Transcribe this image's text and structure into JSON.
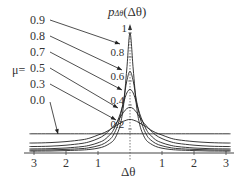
{
  "chart_data": {
    "type": "line",
    "xlabel": "Δθ",
    "ylabel": "p_{Δθ}(Δθ)",
    "xlim": [
      -3.14,
      3.14
    ],
    "ylim": [
      0,
      1.05
    ],
    "x_tick_labels": [
      "3",
      "2",
      "1",
      "1",
      "2",
      "3"
    ],
    "x_ticks": [
      -3,
      -2,
      -1,
      1,
      2,
      3
    ],
    "y_tick_labels": [
      "1",
      "0.8",
      "0.6",
      "0.4",
      "0.2"
    ],
    "y_ticks": [
      1,
      0.8,
      0.6,
      0.4,
      0.2
    ],
    "grid": false,
    "legend_prefix": "μ=",
    "legend_position": "left, with arrows pointing to curves",
    "x": [
      0,
      0.1,
      0.2,
      0.3,
      0.4,
      0.5,
      0.6,
      0.8,
      1.0,
      1.25,
      1.5,
      2.0,
      2.5,
      3.0,
      3.14
    ],
    "series": [
      {
        "name": "0.9",
        "peak": 1.0,
        "values": [
          1.0,
          0.7,
          0.4,
          0.24,
          0.16,
          0.11,
          0.085,
          0.055,
          0.04,
          0.03,
          0.025,
          0.02,
          0.017,
          0.016,
          0.016
        ]
      },
      {
        "name": "0.8",
        "peak": 0.68,
        "values": [
          0.68,
          0.6,
          0.44,
          0.31,
          0.22,
          0.16,
          0.12,
          0.08,
          0.06,
          0.045,
          0.037,
          0.03,
          0.026,
          0.024,
          0.024
        ]
      },
      {
        "name": "0.7",
        "peak": 0.53,
        "values": [
          0.53,
          0.5,
          0.42,
          0.33,
          0.26,
          0.2,
          0.16,
          0.11,
          0.085,
          0.065,
          0.053,
          0.042,
          0.036,
          0.034,
          0.034
        ]
      },
      {
        "name": "0.5",
        "peak": 0.38,
        "values": [
          0.38,
          0.37,
          0.34,
          0.3,
          0.26,
          0.23,
          0.2,
          0.15,
          0.12,
          0.095,
          0.08,
          0.065,
          0.057,
          0.054,
          0.054
        ]
      },
      {
        "name": "0.3",
        "peak": 0.28,
        "values": [
          0.28,
          0.275,
          0.265,
          0.25,
          0.235,
          0.22,
          0.2,
          0.17,
          0.15,
          0.125,
          0.11,
          0.095,
          0.087,
          0.083,
          0.083
        ]
      },
      {
        "name": "0.0",
        "peak": 0.16,
        "values": [
          0.16,
          0.16,
          0.16,
          0.16,
          0.16,
          0.16,
          0.16,
          0.16,
          0.16,
          0.16,
          0.16,
          0.16,
          0.16,
          0.16,
          0.16
        ]
      }
    ],
    "annotations": [
      {
        "text": "0.9",
        "points_to": "curve μ=0.9 near peak"
      },
      {
        "text": "0.8",
        "points_to": "curve μ=0.8"
      },
      {
        "text": "0.7",
        "points_to": "curve μ=0.7"
      },
      {
        "text": "0.5",
        "points_to": "curve μ=0.5"
      },
      {
        "text": "0.3",
        "points_to": "curve μ=0.3"
      },
      {
        "text": "0.0",
        "points_to": "flat line μ=0.0"
      }
    ]
  },
  "labels": {
    "mu_prefix": "μ=",
    "title_main": "p",
    "title_sub": "Δθ",
    "title_arg": "(Δθ)",
    "xlabel": "Δθ"
  }
}
